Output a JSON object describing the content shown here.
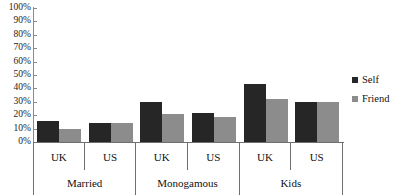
{
  "chart_data": {
    "type": "bar",
    "title": "",
    "xlabel": "",
    "ylabel": "",
    "ylim": [
      0,
      100
    ],
    "grid": false,
    "legend_position": "right",
    "y_ticks": [
      "0%",
      "10%",
      "20%",
      "30%",
      "40%",
      "50%",
      "60%",
      "70%",
      "80%",
      "90%",
      "100%"
    ],
    "y_tick_values": [
      0,
      10,
      20,
      30,
      40,
      50,
      60,
      70,
      80,
      90,
      100
    ],
    "groups": [
      "Married",
      "Monogamous",
      "Kids"
    ],
    "categories": [
      "UK",
      "US",
      "UK",
      "US",
      "UK",
      "US"
    ],
    "series": [
      {
        "name": "Self",
        "color": "#262626",
        "values": [
          16,
          14.5,
          29.5,
          22,
          43,
          29.5
        ]
      },
      {
        "name": "Friend",
        "color": "#8c8c8c",
        "values": [
          10,
          14.5,
          21,
          19,
          32,
          29.5
        ]
      }
    ],
    "points": [
      {
        "group": "Married",
        "category": "UK",
        "Self": 16,
        "Friend": 10
      },
      {
        "group": "Married",
        "category": "US",
        "Self": 14.5,
        "Friend": 14.5
      },
      {
        "group": "Monogamous",
        "category": "UK",
        "Self": 29.5,
        "Friend": 21
      },
      {
        "group": "Monogamous",
        "category": "US",
        "Self": 22,
        "Friend": 19
      },
      {
        "group": "Kids",
        "category": "UK",
        "Self": 43,
        "Friend": 32
      },
      {
        "group": "Kids",
        "category": "US",
        "Self": 29.5,
        "Friend": 29.5
      }
    ]
  },
  "axis": {
    "ticks": [
      {
        "label": "100%",
        "value": 100
      },
      {
        "label": "90%",
        "value": 90
      },
      {
        "label": "80%",
        "value": 80
      },
      {
        "label": "70%",
        "value": 70
      },
      {
        "label": "60%",
        "value": 60
      },
      {
        "label": "50%",
        "value": 50
      },
      {
        "label": "40%",
        "value": 40
      },
      {
        "label": "30%",
        "value": 30
      },
      {
        "label": "20%",
        "value": 20
      },
      {
        "label": "10%",
        "value": 10
      },
      {
        "label": "0%",
        "value": 0
      }
    ]
  },
  "categories_row": [
    {
      "label": "UK"
    },
    {
      "label": "US"
    },
    {
      "label": "UK"
    },
    {
      "label": "US"
    },
    {
      "label": "UK"
    },
    {
      "label": "US"
    }
  ],
  "groups_row": [
    {
      "label": "Married"
    },
    {
      "label": "Monogamous"
    },
    {
      "label": "Kids"
    }
  ],
  "legend": {
    "items": [
      {
        "label": "Self",
        "color": "#262626"
      },
      {
        "label": "Friend",
        "color": "#8c8c8c"
      }
    ]
  }
}
